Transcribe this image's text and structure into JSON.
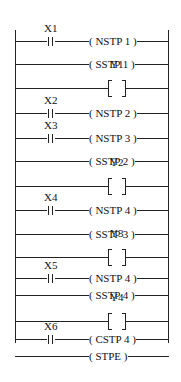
{
  "diagram": {
    "type": "ladder-logic",
    "rungs": [
      {
        "contact": "X1",
        "coil": "( NSTP  1 )"
      },
      {
        "contact": null,
        "coil": "( SSTP  1 )"
      },
      {
        "contact": null,
        "output": "Y1"
      },
      {
        "contact": "X2",
        "coil": "( NSTP  2 )"
      },
      {
        "contact": "X3",
        "coil": "( NSTP  3 )"
      },
      {
        "contact": null,
        "coil": "( SSTP  2 )"
      },
      {
        "contact": null,
        "output": "Y2"
      },
      {
        "contact": "X4",
        "coil": "( NSTP  4 )"
      },
      {
        "contact": null,
        "coil": "( SSTP  3 )"
      },
      {
        "contact": null,
        "output": "Y3"
      },
      {
        "contact": "X5",
        "coil": "( NSTP 4 )"
      },
      {
        "contact": null,
        "coil": "( SSTP 4 )"
      },
      {
        "contact": null,
        "output": "Y4"
      },
      {
        "contact": "X6",
        "coil": "( CSTP 4 )"
      },
      {
        "contact": null,
        "coil": "(  STPE  )"
      }
    ]
  }
}
